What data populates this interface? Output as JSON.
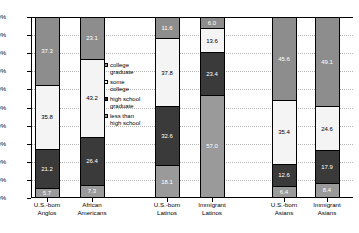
{
  "chart_data": {
    "type": "bar",
    "subtype": "stacked-100-percent",
    "title": "",
    "xlabel": "",
    "ylabel": "",
    "ylim": [
      0,
      100
    ],
    "grid": true,
    "legend_position": "inside-center-left",
    "categories": [
      "U.S.-born Anglos",
      "African Americans",
      "U.S.-born Latinos",
      "Immigrant Latinos",
      "U.S.-born Asians",
      "Immigrant Asians"
    ],
    "series": [
      {
        "name": "college graduate",
        "color": "#8d8d8d",
        "values": [
          37.3,
          23.1,
          11.6,
          6.0,
          45.6,
          49.1
        ]
      },
      {
        "name": "some college",
        "color": "#f4f4f4",
        "values": [
          35.8,
          43.2,
          37.8,
          13.6,
          35.4,
          24.6
        ]
      },
      {
        "name": "high school graduate",
        "color": "#3a3a3a",
        "values": [
          21.2,
          26.4,
          32.6,
          23.4,
          12.6,
          17.9
        ]
      },
      {
        "name": "less than high school",
        "color": "#9a9a9a",
        "values": [
          5.7,
          7.3,
          18.1,
          57.0,
          6.4,
          8.4
        ]
      }
    ],
    "y_ticks": [
      "0%",
      "10%",
      "20%",
      "30%",
      "40%",
      "50%",
      "60%",
      "70%",
      "80%",
      "90%",
      "100%"
    ]
  },
  "legend": {
    "items": [
      {
        "label_line1": "college",
        "label_line2": "graduate",
        "swatch": "c-college"
      },
      {
        "label_line1": "some",
        "label_line2": "college",
        "swatch": "c-some"
      },
      {
        "label_line1": "high school",
        "label_line2": "graduate",
        "swatch": "c-hs"
      },
      {
        "label_line1": "less than",
        "label_line2": "high school",
        "swatch": "c-less"
      }
    ]
  },
  "x_axis": {
    "labels": [
      {
        "line1": "U.S.-born",
        "line2": "Anglos"
      },
      {
        "line1": "African",
        "line2": "Americans"
      },
      {
        "line1": "U.S.-born",
        "line2": "Latinos"
      },
      {
        "line1": "Immigrant",
        "line2": "Latinos"
      },
      {
        "line1": "U.S.-born",
        "line2": "Asians"
      },
      {
        "line1": "Immigrant",
        "line2": "Asians"
      }
    ]
  }
}
